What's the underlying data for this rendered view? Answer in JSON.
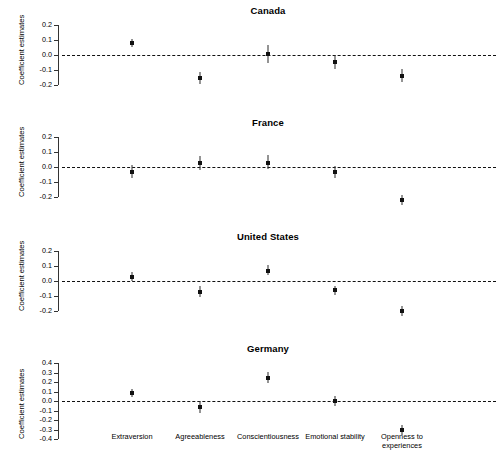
{
  "figure": {
    "ylabel": "Coefficient estimates",
    "categories": [
      "Extraversion",
      "Agreeableness",
      "Conscientiousness",
      "Emotional stability",
      "Openness to experiences"
    ]
  },
  "panels": [
    {
      "title": "Canada",
      "yticks": [
        "0.2",
        "0.1",
        "0.0",
        "-0.1",
        "-0.2"
      ],
      "ylabel": "Coefficient estimates"
    },
    {
      "title": "France",
      "yticks": [
        "0.2",
        "0.1",
        "0.0",
        "-0.1",
        "-0.2"
      ],
      "ylabel": "Coefficient estimates"
    },
    {
      "title": "United States",
      "yticks": [
        "0.2",
        "0.1",
        "0.0",
        "-0.1",
        "-0.2"
      ],
      "ylabel": "Coefficient estimates"
    },
    {
      "title": "Germany",
      "yticks": [
        "0.4",
        "0.3",
        "0.2",
        "0.1",
        "0.0",
        "-0.1",
        "-0.2",
        "-0.3",
        "-0.4"
      ],
      "ylabel": "Coefficient estimates"
    }
  ],
  "chart_data": {
    "type": "scatter",
    "title": "",
    "xlabel": "",
    "ylabel": "Coefficient estimates",
    "grid": false,
    "legend": "none",
    "reference_line": 0.0,
    "reference_line_style": "dashed",
    "categories": [
      "Extraversion",
      "Agreeableness",
      "Conscientiousness",
      "Emotional stability",
      "Openness to experiences"
    ],
    "panels": [
      {
        "name": "Canada",
        "ylim": [
          -0.25,
          0.22
        ],
        "ytick_values": [
          0.2,
          0.1,
          0.0,
          -0.1,
          -0.2
        ],
        "values": [
          0.08,
          -0.15,
          0.005,
          -0.045,
          -0.14
        ],
        "ci_low": [
          0.055,
          -0.19,
          -0.055,
          -0.09,
          -0.18
        ],
        "ci_high": [
          0.105,
          -0.11,
          0.065,
          0.0,
          -0.095
        ]
      },
      {
        "name": "France",
        "ylim": [
          -0.25,
          0.22
        ],
        "ytick_values": [
          0.2,
          0.1,
          0.0,
          -0.1,
          -0.2
        ],
        "values": [
          -0.03,
          0.025,
          0.03,
          -0.035,
          -0.22
        ],
        "ci_low": [
          -0.075,
          -0.02,
          -0.015,
          -0.075,
          -0.25
        ],
        "ci_high": [
          0.015,
          0.075,
          0.08,
          0.005,
          -0.185
        ]
      },
      {
        "name": "United States",
        "ylim": [
          -0.25,
          0.22
        ],
        "ytick_values": [
          0.2,
          0.1,
          0.0,
          -0.1,
          -0.2
        ],
        "values": [
          0.03,
          -0.07,
          0.07,
          -0.06,
          -0.2
        ],
        "ci_low": [
          0.0,
          -0.105,
          0.04,
          -0.09,
          -0.235
        ],
        "ci_high": [
          0.06,
          -0.035,
          0.105,
          -0.03,
          -0.165
        ]
      },
      {
        "name": "Germany",
        "ylim": [
          -0.45,
          0.45
        ],
        "ytick_values": [
          0.4,
          0.3,
          0.2,
          0.1,
          0.0,
          -0.1,
          -0.2,
          -0.3,
          -0.4
        ],
        "values": [
          0.08,
          -0.065,
          0.245,
          0.0,
          -0.305
        ],
        "ci_low": [
          0.04,
          -0.125,
          0.185,
          -0.055,
          -0.36
        ],
        "ci_high": [
          0.125,
          -0.005,
          0.305,
          0.055,
          -0.25
        ]
      }
    ]
  }
}
